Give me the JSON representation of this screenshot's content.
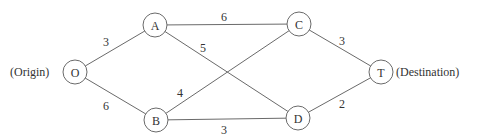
{
  "diagram": {
    "type": "network-graph",
    "nodes": [
      {
        "id": "O",
        "label": "O",
        "x": 75,
        "y": 72,
        "annotation": "(Origin)"
      },
      {
        "id": "A",
        "label": "A",
        "x": 155,
        "y": 25
      },
      {
        "id": "B",
        "label": "B",
        "x": 156,
        "y": 120
      },
      {
        "id": "C",
        "label": "C",
        "x": 299,
        "y": 24
      },
      {
        "id": "D",
        "label": "D",
        "x": 298,
        "y": 118
      },
      {
        "id": "T",
        "label": "T",
        "x": 381,
        "y": 72,
        "annotation": "(Destination)"
      }
    ],
    "edges": [
      {
        "from": "O",
        "to": "A",
        "weight": "3",
        "lx": 106,
        "ly": 46
      },
      {
        "from": "O",
        "to": "B",
        "weight": "6",
        "lx": 106,
        "ly": 110
      },
      {
        "from": "A",
        "to": "C",
        "weight": "6",
        "lx": 224,
        "ly": 21
      },
      {
        "from": "A",
        "to": "D",
        "weight": "5",
        "lx": 203,
        "ly": 52
      },
      {
        "from": "B",
        "to": "C",
        "weight": "4",
        "lx": 180,
        "ly": 97
      },
      {
        "from": "B",
        "to": "D",
        "weight": "3",
        "lx": 224,
        "ly": 134
      },
      {
        "from": "C",
        "to": "T",
        "weight": "3",
        "lx": 342,
        "ly": 45
      },
      {
        "from": "D",
        "to": "T",
        "weight": "2",
        "lx": 342,
        "ly": 108
      }
    ],
    "origin_label": "(Origin)",
    "destination_label": "(Destination)"
  }
}
